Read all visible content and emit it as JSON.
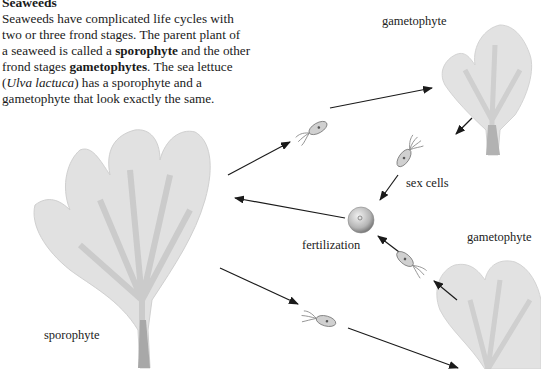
{
  "intro": {
    "title": "Seaweeds",
    "line1": "Seaweeds have complicated life cycles with",
    "line2": "two or three frond stages. The parent plant of",
    "line3a": "a seaweed is called a ",
    "term_sporophyte": "sporophyte",
    "line3b": " and the other",
    "line4a": "frond stages ",
    "term_gametophytes": "gametophytes",
    "line4b": ". The sea lettuce",
    "line5a": "(",
    "species": "Ulva lactuca",
    "line5b": ") has a sporophyte and a",
    "line6": "gametophyte that look exactly the same."
  },
  "labels": {
    "gametophyte_top": "gametophyte",
    "sex_cells": "sex cells",
    "fertilization": "fertilization",
    "gametophyte_bottom": "gametophyte",
    "sporophyte": "sporophyte"
  },
  "colors": {
    "frond": "#c8c8c8",
    "frond_dark": "#9a9a9a",
    "arrow": "#1a1a1a",
    "cell": "#8a8a8a"
  }
}
